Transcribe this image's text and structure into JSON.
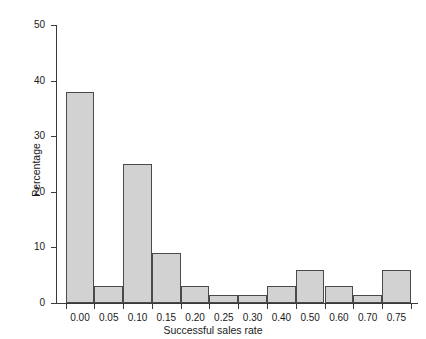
{
  "chart_data": {
    "type": "bar",
    "title": "",
    "xlabel": "Successful sales rate",
    "ylabel": "Percentage",
    "categories": [
      "0.00",
      "0.05",
      "0.10",
      "0.15",
      "0.20",
      "0.25",
      "0.30",
      "0.40",
      "0.50",
      "0.60",
      "0.70",
      "0.75"
    ],
    "values": [
      38,
      3,
      25,
      9,
      3,
      1.5,
      1.5,
      3,
      6,
      3,
      1.5,
      6
    ],
    "xlim": [
      -0.025,
      0.8
    ],
    "ylim": [
      0,
      50
    ],
    "yticks": [
      0,
      10,
      20,
      30,
      40,
      50
    ],
    "ytick_labels": [
      "0",
      "10",
      "20",
      "30",
      "40",
      "50"
    ],
    "xtick_labels": [
      "0.00",
      "0.05",
      "0.10",
      "0.15",
      "0.20",
      "0.25",
      "0.30",
      "0.40",
      "0.50",
      "0.60",
      "0.70",
      "0.75"
    ],
    "grid": false,
    "legend": null,
    "bar_fill_color": "#d2d2d2",
    "bar_edge_color": "#4a4a4a",
    "axis_color": "#3a3a3a",
    "background_color": "#ffffff"
  }
}
